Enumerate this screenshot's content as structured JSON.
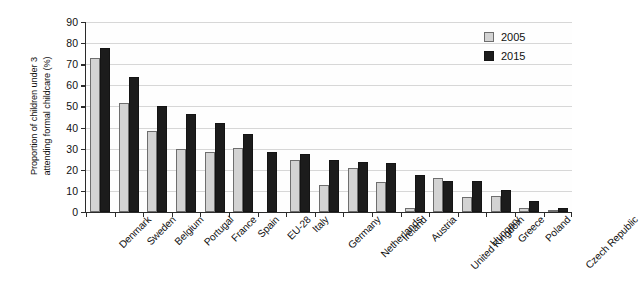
{
  "chart_data": {
    "type": "bar",
    "title": "",
    "xlabel": "",
    "ylabel": "Proportion of children under 3 attending formal childcare (%)",
    "ylabel_line1": "Proportion of children under 3",
    "ylabel_line2": "attending formal childcare (%)",
    "ylim": [
      0,
      90
    ],
    "ytick_step": 10,
    "yticks": [
      0,
      10,
      20,
      30,
      40,
      50,
      60,
      70,
      80,
      90
    ],
    "grid": true,
    "grid_axis": "y",
    "legend_position": "top-right",
    "categories": [
      "Denmark",
      "Sweden",
      "Belgium",
      "Portugal",
      "France",
      "Spain",
      "EU-28",
      "Italy",
      "Germany",
      "Netherlands",
      "Ireland",
      "Austria",
      "United Kingdom",
      "Hungary",
      "Greece",
      "Poland",
      "Czech Republic"
    ],
    "series": [
      {
        "name": "2005",
        "color": "#d3d3d3",
        "edge_color": "#6e6e6e",
        "values": [
          73,
          51.5,
          38.5,
          30,
          28.5,
          30.5,
          null,
          24.8,
          13,
          21,
          14,
          2,
          16,
          7,
          7.5,
          2,
          1
        ]
      },
      {
        "name": "2015",
        "color": "#1c1c1c",
        "edge_color": "#141414",
        "values": [
          77.5,
          64,
          50,
          46.5,
          42,
          37,
          28.5,
          27.5,
          24.5,
          23.5,
          23,
          17.5,
          14.5,
          14.5,
          10.5,
          5,
          2
        ]
      }
    ]
  },
  "legend": {
    "items": [
      {
        "label": "2005"
      },
      {
        "label": "2015"
      }
    ]
  }
}
